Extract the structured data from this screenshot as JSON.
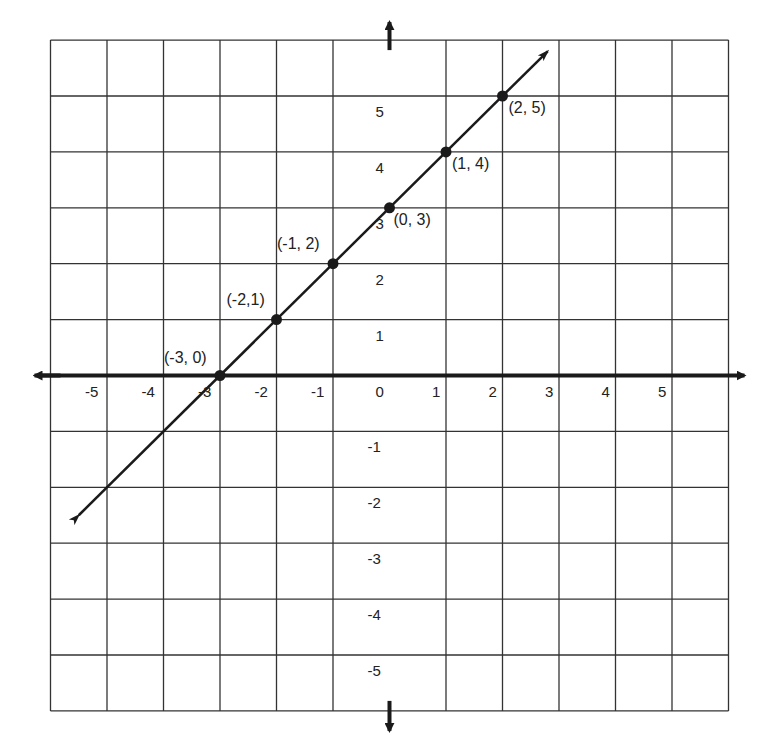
{
  "chart_data": {
    "type": "line",
    "title": "",
    "xlabel": "",
    "ylabel": "",
    "xlim": [
      -6,
      6
    ],
    "ylim": [
      -6,
      6
    ],
    "grid": true,
    "x_ticks": [
      "-5",
      "-4",
      "-3",
      "-2",
      "-1",
      "0",
      "1",
      "2",
      "3",
      "4",
      "5"
    ],
    "y_ticks": [
      "5",
      "4",
      "3",
      "2",
      "1",
      "-1",
      "-2",
      "-3",
      "-4",
      "-5"
    ],
    "series": [
      {
        "name": "y = x + 3",
        "x": [
          -3,
          -2,
          -1,
          0,
          1,
          2
        ],
        "y": [
          0,
          1,
          2,
          3,
          4,
          5
        ]
      }
    ],
    "point_labels": [
      "(-3, 0)",
      "(-2,1)",
      "(-1, 2)",
      "(0, 3)",
      "(1, 4)",
      "(2, 5)"
    ],
    "line_extent": {
      "from": [
        -5.5,
        -2.5
      ],
      "to": [
        2.8,
        5.8
      ]
    }
  },
  "colors": {
    "grid": "#333333",
    "axis": "#1a1a1a",
    "line": "#1a1a1a",
    "background": "#ffffff"
  }
}
